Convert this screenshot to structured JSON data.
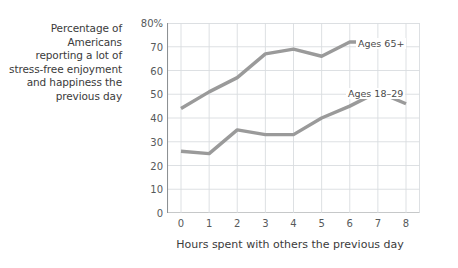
{
  "caption": {
    "lines": [
      "Percentage of Americans",
      "reporting a lot of",
      "stress-free enjoyment",
      "and happiness the",
      "previous day"
    ]
  },
  "chart_data": {
    "type": "line",
    "title": "",
    "xlabel": "Hours spent with others the previous day",
    "ylabel": "Percentage of Americans reporting a lot of stress-free enjoyment and happiness the previous day",
    "x": [
      0,
      1,
      2,
      3,
      4,
      5,
      6,
      7,
      8
    ],
    "xtick_labels": [
      "0",
      "1",
      "2",
      "3",
      "4",
      "5",
      "6",
      "7",
      "8"
    ],
    "ytick_labels": [
      "0",
      "10",
      "20",
      "30",
      "40",
      "50",
      "60",
      "70",
      "80%"
    ],
    "yticks": [
      0,
      10,
      20,
      30,
      40,
      50,
      60,
      70,
      80
    ],
    "xlim": [
      0,
      8
    ],
    "ylim": [
      0,
      80
    ],
    "grid": true,
    "legend_position": "inline-annotation",
    "series": [
      {
        "name": "Ages 65+",
        "color": "#9a9a9a",
        "values": [
          44,
          51,
          57,
          67,
          69,
          66,
          72,
          72,
          71
        ]
      },
      {
        "name": "Ages 18–29",
        "color": "#9a9a9a",
        "values": [
          26,
          25,
          35,
          33,
          33,
          40,
          45,
          51,
          46
        ]
      }
    ],
    "annotations": [
      {
        "text": "Ages 65+",
        "x": 6.7,
        "y": 76
      },
      {
        "text": "Ages 18–29",
        "x": 6.3,
        "y": 55
      }
    ]
  },
  "style": {
    "line_color": "#9a9a9a",
    "grid_color": "#d9dde0",
    "axis_color": "#8d9194",
    "text_color": "#3b3b3b",
    "tick_text_color": "#56595b",
    "background": "#ffffff"
  }
}
